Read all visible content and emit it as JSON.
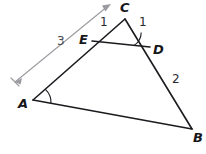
{
  "figure": {
    "background_color": "#ffffff",
    "stroke_color": "#1b1b1f",
    "dimension_color": "#9a9aa0",
    "vertices": [
      {
        "id": "A",
        "label": "A",
        "x": 33,
        "y": 100
      },
      {
        "id": "B",
        "label": "B",
        "x": 192,
        "y": 129
      },
      {
        "id": "C",
        "label": "C",
        "x": 125,
        "y": 19
      },
      {
        "id": "D",
        "label": "D",
        "x": 150,
        "y": 47
      },
      {
        "id": "E",
        "label": "E",
        "x": 92,
        "y": 41
      }
    ],
    "vertex_labels": [
      {
        "name": "vertex-label-a",
        "text": "A",
        "x": 18,
        "y": 97
      },
      {
        "name": "vertex-label-b",
        "text": "B",
        "x": 193,
        "y": 131
      },
      {
        "name": "vertex-label-c",
        "text": "C",
        "x": 120,
        "y": 1
      },
      {
        "name": "vertex-label-d",
        "text": "D",
        "x": 153,
        "y": 43
      },
      {
        "name": "vertex-label-e",
        "text": "E",
        "x": 79,
        "y": 33
      }
    ],
    "segment_measures": [
      {
        "name": "measure-label-ce",
        "text": "1",
        "x": 100,
        "y": 16,
        "segment": "CE"
      },
      {
        "name": "measure-label-cd",
        "text": "1",
        "x": 139,
        "y": 16,
        "segment": "CD"
      },
      {
        "name": "measure-label-db",
        "text": "2",
        "x": 172,
        "y": 73,
        "segment": "DB"
      },
      {
        "name": "measure-label-ac",
        "text": "3",
        "x": 57,
        "y": 35,
        "segment": "AC"
      }
    ],
    "edges": [
      {
        "name": "edge-a-to-c",
        "from": "A",
        "to": "C"
      },
      {
        "name": "edge-c-to-b",
        "from": "C",
        "to": "B"
      },
      {
        "name": "edge-a-to-b",
        "from": "A",
        "to": "B"
      },
      {
        "name": "edge-e-to-d",
        "from": "E",
        "to": "D"
      }
    ],
    "angle_arcs": [
      {
        "name": "angle-arc-at-a",
        "at": "A"
      },
      {
        "name": "angle-arc-at-d",
        "at": "D"
      }
    ],
    "dimension_arrow": {
      "name": "dimension-arrow-ac",
      "label": "3",
      "tail_x": 14,
      "tail_y": 83,
      "head_x": 111,
      "head_y": 4
    }
  }
}
